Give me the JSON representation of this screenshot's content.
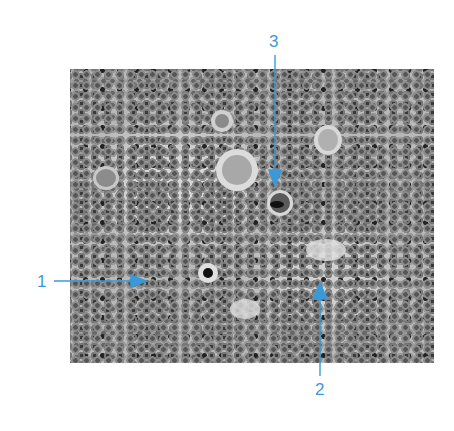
{
  "figure": {
    "type": "histology micrograph (grayscale)",
    "annotation_color": "#3a9ad9",
    "labels": [
      {
        "id": "1",
        "text": "1",
        "pointer": "arrow pointing right to a cell"
      },
      {
        "id": "2",
        "text": "2",
        "pointer": "arrow pointing up to a cell"
      },
      {
        "id": "3",
        "text": "3",
        "pointer": "arrow pointing down to a large dark cell"
      }
    ]
  }
}
